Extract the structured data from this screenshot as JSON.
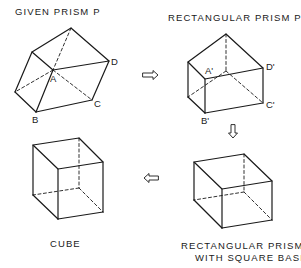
{
  "titles": {
    "given": "GIVEN  PRISM  P",
    "rect": "RECTANGULAR  PRISM  P'",
    "cube": "CUBE",
    "square_line1": "RECTANGULAR  PRISM  P\"",
    "square_line2": "WITH  SQUARE  BASE"
  },
  "vertex_labels": {
    "p": {
      "A": "A",
      "B": "B",
      "C": "C",
      "D": "D"
    },
    "p_prime": {
      "A": "A'",
      "B": "B'",
      "C": "C'",
      "D": "D'"
    }
  },
  "arrows": {
    "p_to_p_prime": "right",
    "p_prime_to_p_double": "down",
    "p_double_to_cube": "left"
  },
  "colors": {
    "line": "#1a1a1a",
    "background": "#ffffff"
  }
}
